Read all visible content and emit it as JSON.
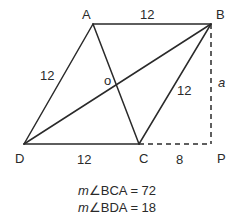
{
  "diagram": {
    "points": {
      "A": {
        "label": "A",
        "x": 93,
        "y": 24
      },
      "B": {
        "label": "B",
        "x": 211,
        "y": 24
      },
      "C": {
        "label": "C",
        "x": 139,
        "y": 144
      },
      "D": {
        "label": "D",
        "x": 24,
        "y": 144
      },
      "P": {
        "label": "P",
        "x": 211,
        "y": 144
      },
      "O": {
        "label": "o",
        "x": 116,
        "y": 84
      }
    },
    "segment_labels": {
      "AB": "12",
      "AD": "12",
      "BC": "12",
      "DC": "12",
      "CP": "8",
      "BP": "a"
    },
    "line_color": "#2a2a2a"
  },
  "given": {
    "line1": {
      "m": "m",
      "angle": "∠BCA = 72"
    },
    "line2": {
      "m": "m",
      "angle": "∠BDA = 18"
    }
  }
}
